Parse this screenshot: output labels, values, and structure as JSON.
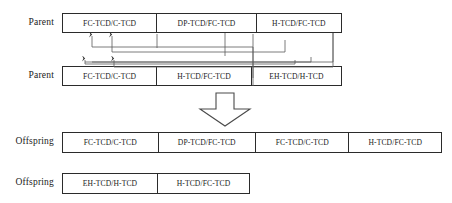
{
  "diagram": {
    "type": "genetic-algorithm-crossover",
    "background_color": "#ffffff",
    "line_color": "#2b2b2b",
    "wire_color": "#555555",
    "rows": [
      {
        "id": "parent-1",
        "label": "Parent",
        "cells": [
          "FC-TCD/C-TCD",
          "DP-TCD/FC-TCD",
          "H-TCD/FC-TCD"
        ]
      },
      {
        "id": "parent-2",
        "label": "Parent",
        "cells": [
          "FC-TCD/C-TCD",
          "H-TCD/FC-TCD",
          "EH-TCD/H-TCD"
        ]
      },
      {
        "id": "offspring-1",
        "label": "Offspring",
        "cells": [
          "FC-TCD/C-TCD",
          "DP-TCD/FC-TCD",
          "FC-TCD/C-TCD",
          "H-TCD/FC-TCD"
        ]
      },
      {
        "id": "offspring-2",
        "label": "Offspring",
        "cells": [
          "EH-TCD/H-TCD",
          "H-TCD/FC-TCD"
        ]
      }
    ],
    "transform_arrow": "down-block-arrow"
  }
}
